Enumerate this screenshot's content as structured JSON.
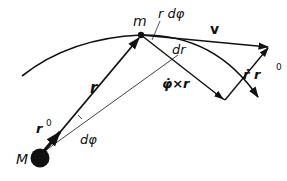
{
  "diagram": {
    "labels": {
      "central_mass": "M",
      "moving_mass": "m",
      "position_vector": "r",
      "unit_vector": "r",
      "unit_vector_sup": "0",
      "arc_element": "r dφ",
      "radial_element": "dr",
      "velocity": "v",
      "tangential_component": "φ̇×r",
      "radial_component": "ṙ r",
      "radial_component_sup": "0",
      "angle": "dφ"
    },
    "colors": {
      "stroke": "#111111",
      "background": "#ffffff"
    }
  }
}
